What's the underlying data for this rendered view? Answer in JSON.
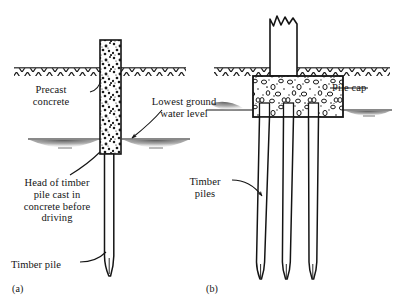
{
  "figure": {
    "width": 398,
    "height": 308,
    "background": "#ffffff",
    "ink_color": "#141414"
  },
  "panels": [
    {
      "id": "a",
      "caption": "(a)",
      "description": "Single timber pile with head cast in precast concrete, driven below lowest ground water level",
      "labels": [
        {
          "name": "precast-concrete",
          "text": "Precast\nconcrete",
          "lines": [
            "Precast",
            "concrete"
          ],
          "align": "center"
        },
        {
          "name": "lowest-ground-water-level",
          "text": "Lowest ground\nwater level",
          "lines": [
            "Lowest ground",
            "water level"
          ],
          "align": "center"
        },
        {
          "name": "head-of-timber-pile",
          "text": "Head of timber\npile cast in\nconcrete before\ndriving",
          "lines": [
            "Head of timber",
            "pile cast in",
            "concrete before",
            "driving"
          ],
          "align": "center"
        },
        {
          "name": "timber-pile",
          "text": "Timber pile",
          "lines": [
            "Timber pile"
          ],
          "align": "left"
        }
      ]
    },
    {
      "id": "b",
      "caption": "(b)",
      "description": "Pile cap on a group of three timber piles beneath a broken-off column",
      "labels": [
        {
          "name": "pile-cap",
          "text": "Pile cap",
          "lines": [
            "Pile cap"
          ],
          "align": "left"
        },
        {
          "name": "timber-piles",
          "text": "Timber\npiles",
          "lines": [
            "Timber",
            "piles"
          ],
          "align": "center"
        }
      ]
    }
  ],
  "symbols": {
    "ground_line": "hatched ground surface line",
    "water_table": "water-level line with shaded lens below",
    "concrete_fill": "stippled aggregate concrete texture",
    "break_symbol": "jagged broken column top"
  }
}
